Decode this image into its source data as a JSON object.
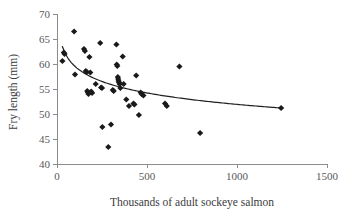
{
  "chart_data": {
    "type": "scatter",
    "title": "",
    "xlabel": "Thousands of adult sockeye salmon",
    "ylabel": "Fry length (mm)",
    "xlim": [
      0,
      1500
    ],
    "ylim": [
      40,
      70
    ],
    "xticks": [
      0,
      500,
      1000,
      1500
    ],
    "yticks": [
      40,
      45,
      50,
      55,
      60,
      65,
      70
    ],
    "xtick_labels": [
      "0",
      "500",
      "1000",
      "1500"
    ],
    "ytick_labels": [
      "40",
      "45",
      "50",
      "55",
      "60",
      "65",
      "70"
    ],
    "grid": false,
    "legend": false,
    "marker": "diamond",
    "marker_color": "#1a1a1a",
    "axis_color": "#8c8c8e",
    "background_color": "#ffffff",
    "points": [
      {
        "x": 30,
        "y": 60.6
      },
      {
        "x": 38,
        "y": 62.3
      },
      {
        "x": 42,
        "y": 62.0
      },
      {
        "x": 95,
        "y": 66.5
      },
      {
        "x": 100,
        "y": 57.9
      },
      {
        "x": 150,
        "y": 63.0
      },
      {
        "x": 155,
        "y": 62.6
      },
      {
        "x": 160,
        "y": 58.6
      },
      {
        "x": 165,
        "y": 58.4
      },
      {
        "x": 168,
        "y": 54.6
      },
      {
        "x": 172,
        "y": 54.3
      },
      {
        "x": 175,
        "y": 54.0
      },
      {
        "x": 180,
        "y": 61.4
      },
      {
        "x": 185,
        "y": 58.3
      },
      {
        "x": 190,
        "y": 54.5
      },
      {
        "x": 195,
        "y": 54.2
      },
      {
        "x": 215,
        "y": 56.0
      },
      {
        "x": 240,
        "y": 64.2
      },
      {
        "x": 245,
        "y": 55.3
      },
      {
        "x": 250,
        "y": 55.2
      },
      {
        "x": 252,
        "y": 47.4
      },
      {
        "x": 285,
        "y": 43.4
      },
      {
        "x": 300,
        "y": 47.9
      },
      {
        "x": 310,
        "y": 54.8
      },
      {
        "x": 315,
        "y": 54.6
      },
      {
        "x": 330,
        "y": 63.9
      },
      {
        "x": 332,
        "y": 59.9
      },
      {
        "x": 335,
        "y": 59.6
      },
      {
        "x": 338,
        "y": 57.4
      },
      {
        "x": 340,
        "y": 57.0
      },
      {
        "x": 342,
        "y": 56.6
      },
      {
        "x": 345,
        "y": 56.3
      },
      {
        "x": 348,
        "y": 56.0
      },
      {
        "x": 352,
        "y": 55.2
      },
      {
        "x": 365,
        "y": 61.5
      },
      {
        "x": 370,
        "y": 56.0
      },
      {
        "x": 385,
        "y": 52.9
      },
      {
        "x": 400,
        "y": 51.6
      },
      {
        "x": 425,
        "y": 52.1
      },
      {
        "x": 430,
        "y": 51.9
      },
      {
        "x": 440,
        "y": 57.7
      },
      {
        "x": 455,
        "y": 49.8
      },
      {
        "x": 465,
        "y": 54.3
      },
      {
        "x": 470,
        "y": 54.0
      },
      {
        "x": 480,
        "y": 53.7
      },
      {
        "x": 600,
        "y": 52.1
      },
      {
        "x": 610,
        "y": 51.6
      },
      {
        "x": 680,
        "y": 59.5
      },
      {
        "x": 795,
        "y": 46.2
      },
      {
        "x": 1245,
        "y": 51.2
      }
    ],
    "trend_line": {
      "present": true,
      "shape": "decaying-logarithmic",
      "color": "#231f20",
      "x_start": 30,
      "y_start": 63.5,
      "x_end": 1245,
      "y_end": 51.2
    }
  }
}
